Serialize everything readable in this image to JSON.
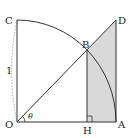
{
  "diagram": {
    "type": "geometry",
    "points": {
      "O": {
        "label": "O",
        "x": 17,
        "y": 122
      },
      "A": {
        "label": "A",
        "x": 116,
        "y": 122
      },
      "C": {
        "label": "C",
        "x": 17,
        "y": 20
      },
      "D": {
        "label": "D",
        "x": 116,
        "y": 20
      },
      "B": {
        "label": "B",
        "x": 87,
        "y": 50
      },
      "H": {
        "label": "H",
        "x": 87,
        "y": 122
      }
    },
    "labels": {
      "O": "O",
      "A": "A",
      "B": "B",
      "C": "C",
      "D": "D",
      "H": "H",
      "radius": "1",
      "angle": "θ"
    },
    "colors": {
      "stroke": "#333333",
      "shade": "#d9d9d9",
      "dashed_arc": "#999999"
    }
  }
}
